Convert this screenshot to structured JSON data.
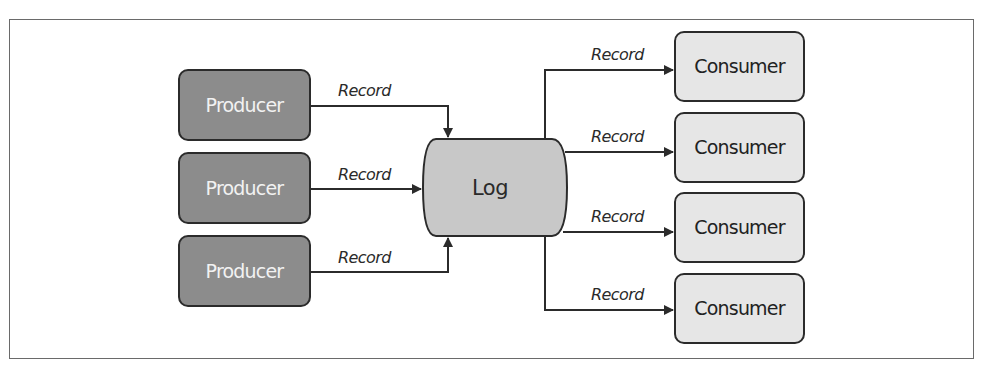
{
  "diagram": {
    "log": {
      "label": "Log"
    },
    "producers": [
      {
        "label": "Producer"
      },
      {
        "label": "Producer"
      },
      {
        "label": "Producer"
      }
    ],
    "consumers": [
      {
        "label": "Consumer"
      },
      {
        "label": "Consumer"
      },
      {
        "label": "Consumer"
      },
      {
        "label": "Consumer"
      }
    ],
    "producer_edges": [
      {
        "label": "Record"
      },
      {
        "label": "Record"
      },
      {
        "label": "Record"
      }
    ],
    "consumer_edges": [
      {
        "label": "Record"
      },
      {
        "label": "Record"
      },
      {
        "label": "Record"
      },
      {
        "label": "Record"
      }
    ],
    "colors": {
      "producer_fill": "#8c8c8c",
      "consumer_fill": "#e6e6e6",
      "log_fill": "#c8c8c8",
      "stroke": "#2b2b2b"
    }
  }
}
